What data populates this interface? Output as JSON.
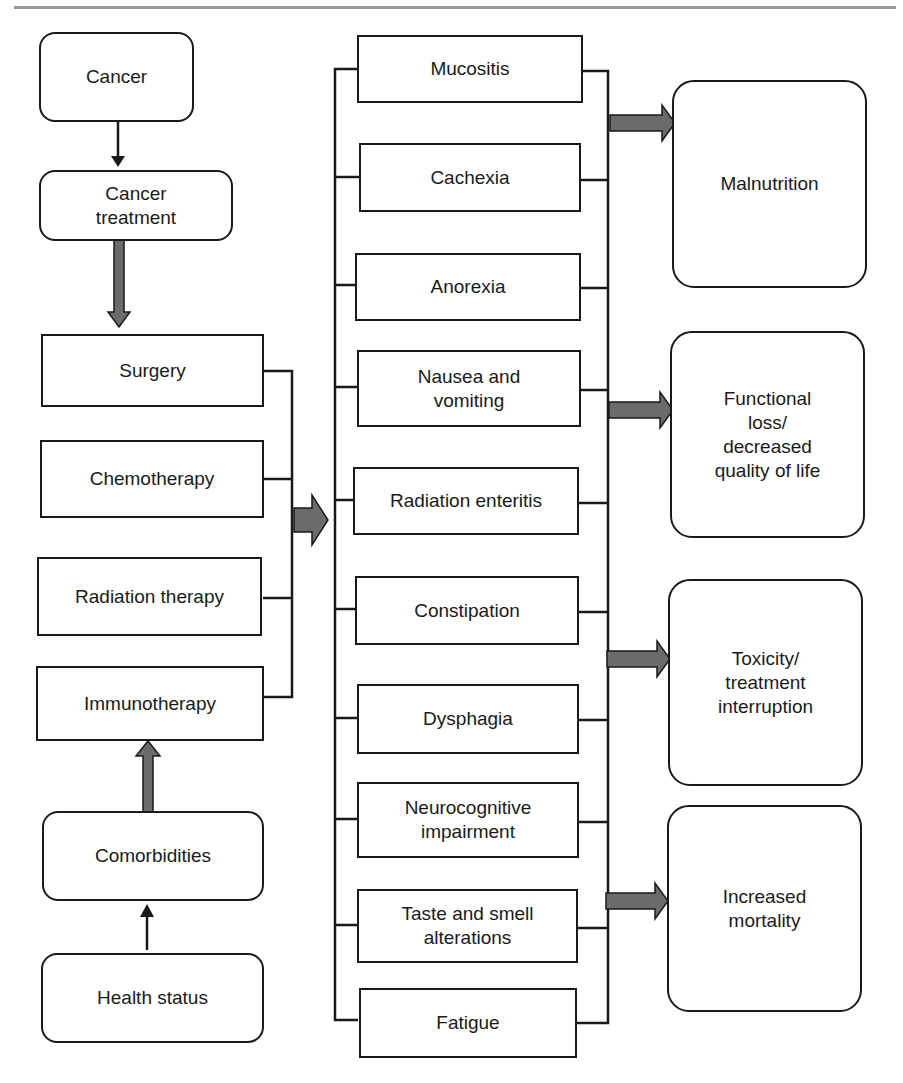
{
  "diagram": {
    "left_column": {
      "cancer": "Cancer",
      "cancer_treatment": "Cancer\ntreatment",
      "treatments": [
        "Surgery",
        "Chemotherapy",
        "Radiation therapy",
        "Immunotherapy"
      ],
      "comorbidities": "Comorbidities",
      "health_status": "Health status"
    },
    "middle_column": {
      "effects": [
        "Mucositis",
        "Cachexia",
        "Anorexia",
        "Nausea and\nvomiting",
        "Radiation enteritis",
        "Constipation",
        "Dysphagia",
        "Neurocognitive\nimpairment",
        "Taste and smell\nalterations",
        "Fatigue"
      ]
    },
    "right_column": {
      "outcomes": [
        "Malnutrition",
        "Functional\nloss/\ndecreased\nquality of life",
        "Toxicity/\ntreatment\ninterruption",
        "Increased\nmortality"
      ]
    },
    "colors": {
      "line": "#1a1a1a",
      "arrow_fill": "#6b6b6b",
      "top_rule": "#9a9a9a"
    }
  }
}
